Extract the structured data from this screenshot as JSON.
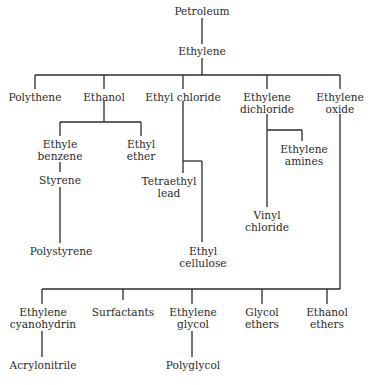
{
  "diagram": {
    "root": "Petroleum",
    "nodes": {
      "petroleum": "Petroleum",
      "ethylene": "Ethylene",
      "polythene": "Polythene",
      "ethanol": "Ethanol",
      "ethyl_chloride": "Ethyl chloride",
      "ethylene_dichloride_1": "Ethylene",
      "ethylene_dichloride_2": "dichloride",
      "ethylene_oxide_1": "Ethylene",
      "ethylene_oxide_2": "oxide",
      "ethyle_benzene_1": "Ethyle",
      "ethyle_benzene_2": "benzene",
      "ethyl_ether_1": "Ethyl",
      "ethyl_ether_2": "ether",
      "styrene": "Styrene",
      "polystyrene": "Polystyrene",
      "tetraethyl_lead_1": "Tetraethyl",
      "tetraethyl_lead_2": "lead",
      "ethyl_cellulose_1": "Ethyl",
      "ethyl_cellulose_2": "cellulose",
      "ethylene_amines_1": "Ethylene",
      "ethylene_amines_2": "amines",
      "vinyl_chloride_1": "Vinyl",
      "vinyl_chloride_2": "chloride",
      "ethylene_cyanohydrin_1": "Ethylene",
      "ethylene_cyanohydrin_2": "cyanohydrin",
      "surfactants": "Surfactants",
      "ethylene_glycol_1": "Ethylene",
      "ethylene_glycol_2": "glycol",
      "glycol_ethers_1": "Glycol",
      "glycol_ethers_2": "ethers",
      "ethanol_ethers_1": "Ethanol",
      "ethanol_ethers_2": "ethers",
      "acrylonitrile": "Acrylonitrile",
      "polyglycol": "Polyglycol"
    },
    "edges": [
      [
        "Petroleum",
        "Ethylene"
      ],
      [
        "Ethylene",
        "Polythene"
      ],
      [
        "Ethylene",
        "Ethanol"
      ],
      [
        "Ethylene",
        "Ethyl chloride"
      ],
      [
        "Ethylene",
        "Ethylene dichloride"
      ],
      [
        "Ethylene",
        "Ethylene oxide"
      ],
      [
        "Ethanol",
        "Ethyle benzene"
      ],
      [
        "Ethanol",
        "Ethyl ether"
      ],
      [
        "Ethyle benzene",
        "Styrene"
      ],
      [
        "Styrene",
        "Polystyrene"
      ],
      [
        "Ethyl chloride",
        "Tetraethyl lead"
      ],
      [
        "Ethyl chloride",
        "Ethyl cellulose"
      ],
      [
        "Ethylene dichloride",
        "Ethylene amines"
      ],
      [
        "Ethylene dichloride",
        "Vinyl chloride"
      ],
      [
        "Ethylene oxide",
        "Ethylene cyanohydrin"
      ],
      [
        "Ethylene oxide",
        "Surfactants"
      ],
      [
        "Ethylene oxide",
        "Ethylene glycol"
      ],
      [
        "Ethylene oxide",
        "Glycol ethers"
      ],
      [
        "Ethylene oxide",
        "Ethanol ethers"
      ],
      [
        "Ethylene cyanohydrin",
        "Acrylonitrile"
      ],
      [
        "Ethylene glycol",
        "Polyglycol"
      ]
    ],
    "line_color": "#2b2b2b",
    "caption": ""
  }
}
